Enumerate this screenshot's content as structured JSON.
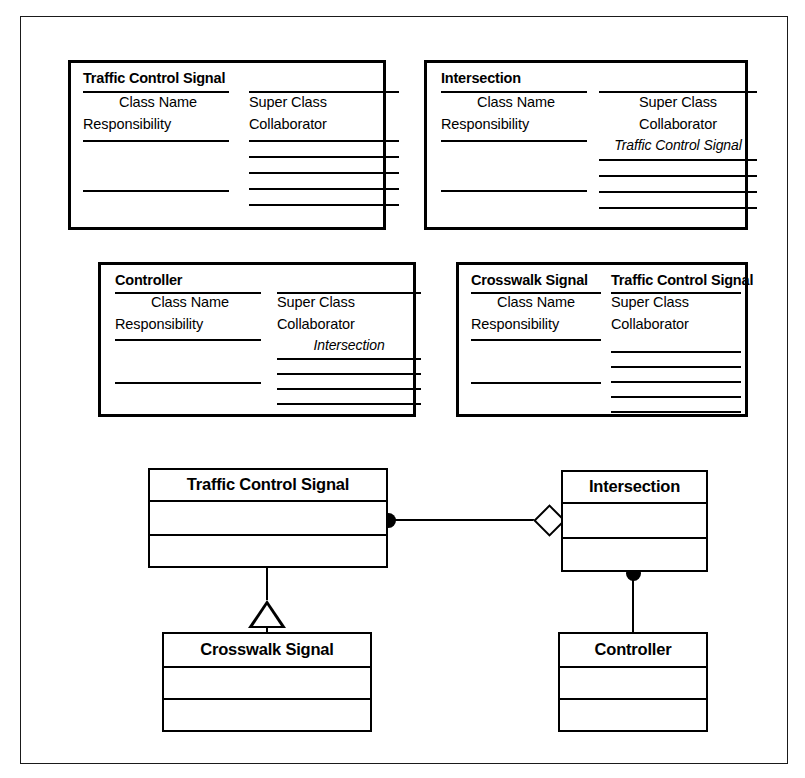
{
  "diagram": {
    "kind": "CRC cards and UML class diagram"
  },
  "crc_cards": [
    {
      "id": "traffic-control-signal",
      "title": "Traffic Control Signal",
      "right_title": "",
      "left": {
        "label_1": "Class Name",
        "label_2": "Responsibility",
        "blank_rules": 2
      },
      "right": {
        "label_1": "Super Class",
        "label_2": "Collaborator",
        "entry": "",
        "blank_rules": 6
      }
    },
    {
      "id": "intersection",
      "title": "Intersection",
      "right_title": "",
      "left": {
        "label_1": "Class Name",
        "label_2": "Responsibility",
        "blank_rules": 2
      },
      "right": {
        "label_1": "Super Class",
        "label_2": "Collaborator",
        "entry": "Traffic Control Signal",
        "blank_rules": 5
      }
    },
    {
      "id": "controller",
      "title": "Controller",
      "right_title": "",
      "left": {
        "label_1": "Class Name",
        "label_2": "Responsibility",
        "blank_rules": 2
      },
      "right": {
        "label_1": "Super Class",
        "label_2": "Collaborator",
        "entry": "Intersection",
        "blank_rules": 5
      }
    },
    {
      "id": "crosswalk-signal",
      "title": "Crosswalk Signal",
      "right_title": "Traffic Control Signal",
      "left": {
        "label_1": "Class Name",
        "label_2": "Responsibility",
        "blank_rules": 2
      },
      "right": {
        "label_1": "Super Class",
        "label_2": "Collaborator",
        "entry": "",
        "blank_rules": 5
      }
    }
  ],
  "uml": {
    "classes": [
      {
        "id": "traffic-control-signal",
        "name": "Traffic Control Signal"
      },
      {
        "id": "intersection",
        "name": "Intersection"
      },
      {
        "id": "crosswalk-signal",
        "name": "Crosswalk Signal"
      },
      {
        "id": "controller",
        "name": "Controller"
      }
    ],
    "relationships": [
      {
        "id": "tcs-intersection",
        "from": "traffic-control-signal",
        "to": "intersection",
        "type": "aggregation",
        "from_adornment": "filled-circle",
        "to_adornment": "hollow-diamond"
      },
      {
        "id": "intersection-controller",
        "from": "intersection",
        "to": "controller",
        "type": "association",
        "from_adornment": "filled-circle",
        "to_adornment": "none"
      },
      {
        "id": "crosswalk-generalization",
        "from": "crosswalk-signal",
        "to": "traffic-control-signal",
        "type": "generalization",
        "from_adornment": "none",
        "to_adornment": "hollow-triangle"
      }
    ]
  },
  "colors": {
    "ink": "#000000",
    "paper": "#ffffff",
    "sheet_border": "#1a1a1a"
  }
}
